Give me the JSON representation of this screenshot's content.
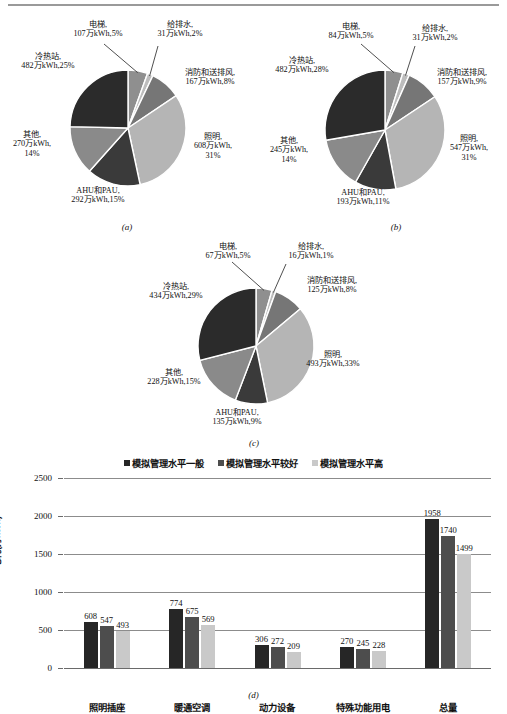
{
  "figure": {
    "subcaptions": [
      "(a)",
      "(b)",
      "(c)",
      "(d)"
    ]
  },
  "colors": {
    "slice_elevator": "#8f8f8f",
    "slice_water": "#bdbdbd",
    "slice_fire_vent": "#767676",
    "slice_lighting": "#b5b5b5",
    "slice_ahu_pau": "#3a3a3a",
    "slice_other": "#8a8a8a",
    "slice_cold_heat": "#2b2b2b",
    "bar_series_1": "#262626",
    "bar_series_2": "#4d4d4d",
    "bar_series_3": "#c9c9c9",
    "gridline": "#8c8c8c",
    "rule": "#9a9a9a"
  },
  "chart_data": [
    {
      "type": "pie",
      "id": "a",
      "title": "(a)",
      "unit": "万kWh",
      "categories": [
        "电梯",
        "给排水",
        "消防和送排风",
        "照明",
        "AHU和PAU",
        "其他",
        "冷热站"
      ],
      "values": [
        107,
        31,
        167,
        608,
        292,
        270,
        482
      ],
      "percents": [
        5,
        2,
        8,
        31,
        15,
        14,
        25
      ],
      "labels": [
        "电梯,\n107万kWh,5%",
        "给排水,\n31万kWh,2%",
        "消防和送排风,\n167万kWh,8%",
        "照明,\n608万kWh,\n31%",
        "AHU和PAU,\n292万kWh,15%",
        "其他,\n270万kWh,\n14%",
        "冷热站,\n482万kWh,25%"
      ],
      "label_lines": [
        [
          "电梯,",
          "107万kWh,5%"
        ],
        [
          "给排水,",
          "31万kWh,2%"
        ],
        [
          "消防和送排风,",
          "167万kWh,8%"
        ],
        [
          "照明,",
          "608万kWh,",
          "31%"
        ],
        [
          "AHU和PAU,",
          "292万kWh,15%"
        ],
        [
          "其他,",
          "270万kWh,",
          "14%"
        ],
        [
          "冷热站,",
          "482万kWh,25%"
        ]
      ]
    },
    {
      "type": "pie",
      "id": "b",
      "title": "(b)",
      "unit": "万kWh",
      "categories": [
        "电梯",
        "给排水",
        "消防和送排风",
        "照明",
        "AHU和PAU",
        "其他",
        "冷热站"
      ],
      "values": [
        84,
        31,
        157,
        547,
        193,
        245,
        482
      ],
      "percents": [
        5,
        2,
        9,
        31,
        11,
        14,
        28
      ],
      "label_lines": [
        [
          "电梯,",
          "84万kWh,5%"
        ],
        [
          "给排水,",
          "31万kWh,2%"
        ],
        [
          "消防和送排风,",
          "157万kWh,9%"
        ],
        [
          "照明,",
          "547万kWh,",
          "31%"
        ],
        [
          "AHU和PAU,",
          "193万kWh,11%"
        ],
        [
          "其他,",
          "245万kWh,",
          "14%"
        ],
        [
          "冷热站,",
          "482万kWh,28%"
        ]
      ]
    },
    {
      "type": "pie",
      "id": "c",
      "title": "(c)",
      "unit": "万kWh",
      "categories": [
        "电梯",
        "给排水",
        "消防和送排风",
        "照明",
        "AHU和PAU",
        "其他",
        "冷热站"
      ],
      "values": [
        67,
        16,
        125,
        493,
        135,
        228,
        434
      ],
      "percents": [
        5,
        1,
        8,
        33,
        9,
        15,
        29
      ],
      "label_lines": [
        [
          "电梯,",
          "67万kWh,5%"
        ],
        [
          "给排水,",
          "16万kWh,1%"
        ],
        [
          "消防和送排风,",
          "125万kWh,8%"
        ],
        [
          "照明,",
          "493万kWh,33%"
        ],
        [
          "AHU和PAU,",
          "135万kWh,9%"
        ],
        [
          "其他,",
          "228万kWh,15%"
        ],
        [
          "冷热站,",
          "434万kWh,29%"
        ]
      ]
    },
    {
      "type": "bar",
      "id": "d",
      "title": "(d)",
      "ylabel": "电耗(万kWh)",
      "xlabel": "",
      "ylim": [
        0,
        2500
      ],
      "yticks": [
        0,
        500,
        1000,
        1500,
        2000,
        2500
      ],
      "ytick_labels": [
        "0",
        "500",
        "1000",
        "1500",
        "2000",
        "2500"
      ],
      "grid": true,
      "legend_position": "top-center",
      "categories": [
        "照明插座",
        "暖通空调",
        "动力设备",
        "特殊功能用电",
        "总量"
      ],
      "series": [
        {
          "name": "模拟管理水平一般",
          "values": [
            608,
            774,
            306,
            270,
            1958
          ]
        },
        {
          "name": "模拟管理水平较好",
          "values": [
            547,
            675,
            272,
            245,
            1740
          ]
        },
        {
          "name": "模拟管理水平高",
          "values": [
            493,
            569,
            209,
            228,
            1499
          ]
        }
      ]
    }
  ]
}
